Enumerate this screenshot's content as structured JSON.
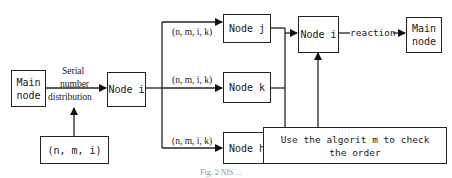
{
  "diagram": {
    "nodes": {
      "main_node_left": "Main\nnode",
      "node_i_left": "Node i",
      "tuple_input": "(n, m, i)",
      "node_j": "Node j",
      "node_k": "Node k",
      "node_h": "Node h",
      "node_i_right": "Node i",
      "main_node_right": "Main\nnode",
      "check_box": "Use the algorit m to check the order"
    },
    "labels": {
      "serial_line1": "Serial",
      "serial_line2": "number",
      "serial_line3": "distribution",
      "tuple_j": "(n, m, i, k)",
      "tuple_k": "(n, m, i, k)",
      "tuple_h": "(n, m, i, k)",
      "reaction": "reaction"
    },
    "edges": [
      {
        "from": "Main node",
        "to": "Node i",
        "label": "Serial number distribution"
      },
      {
        "from": "(n, m, i)",
        "to": "Serial number distribution edge"
      },
      {
        "from": "Node i",
        "to": "Node j",
        "label": "(n, m, i, k)"
      },
      {
        "from": "Node i",
        "to": "Node k",
        "label": "(n, m, i, k)"
      },
      {
        "from": "Node i",
        "to": "Node h",
        "label": "(n, m, i, k)"
      },
      {
        "from": "Node j",
        "to": "Node i (right)"
      },
      {
        "from": "Node k",
        "to": "Node i (right)"
      },
      {
        "from": "Node h",
        "to": "Node i (right)"
      },
      {
        "from": "Use the algorit m to check the order",
        "to": "Node i (right)"
      },
      {
        "from": "Node i (right)",
        "to": "Main node (right)",
        "label": "reaction"
      }
    ],
    "caption": "Fig. 2  NIS ..."
  }
}
